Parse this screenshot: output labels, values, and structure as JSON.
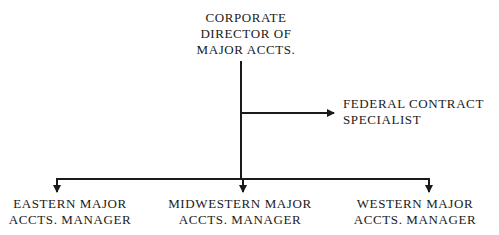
{
  "diagram": {
    "type": "org-chart",
    "nodes": {
      "director": {
        "lines": [
          "CORPORATE",
          "DIRECTOR OF",
          "MAJOR ACCTS."
        ]
      },
      "federal": {
        "lines": [
          "FEDERAL CONTRACT",
          "SPECIALIST"
        ]
      },
      "eastern": {
        "lines": [
          "EASTERN MAJOR",
          "ACCTS. MANAGER"
        ]
      },
      "midwestern": {
        "lines": [
          "MIDWESTERN MAJOR",
          "ACCTS. MANAGER"
        ]
      },
      "western": {
        "lines": [
          "WESTERN MAJOR",
          "ACCTS. MANAGER"
        ]
      }
    },
    "edges": [
      {
        "from": "director",
        "to": "federal",
        "style": "arrow"
      },
      {
        "from": "director",
        "to": "eastern",
        "style": "arrow"
      },
      {
        "from": "director",
        "to": "midwestern",
        "style": "arrow"
      },
      {
        "from": "director",
        "to": "western",
        "style": "arrow"
      }
    ],
    "line_color": "#1a1a1a"
  }
}
